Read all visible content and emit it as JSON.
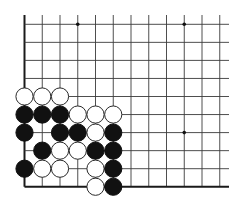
{
  "board": {
    "description": "Go problem diagram, lower-left corner of a 19x19 board",
    "visible_cols": 12,
    "visible_rows": 10,
    "open_top": true,
    "open_right": true,
    "left_edge": true,
    "bottom_edge": true,
    "colors": {
      "background": "#ffffff",
      "line": "#3a3a3a",
      "black": "#111111",
      "white": "#ffffff"
    },
    "hoshi": [
      {
        "col": 3,
        "row": 0
      },
      {
        "col": 9,
        "row": 0
      },
      {
        "col": 3,
        "row": 6
      },
      {
        "col": 9,
        "row": 6
      }
    ],
    "stones": [
      {
        "color": "white",
        "col": 0,
        "row": 4
      },
      {
        "color": "white",
        "col": 1,
        "row": 4
      },
      {
        "color": "white",
        "col": 2,
        "row": 4
      },
      {
        "color": "black",
        "col": 0,
        "row": 5
      },
      {
        "color": "black",
        "col": 1,
        "row": 5
      },
      {
        "color": "black",
        "col": 2,
        "row": 5
      },
      {
        "color": "white",
        "col": 3,
        "row": 5
      },
      {
        "color": "white",
        "col": 4,
        "row": 5
      },
      {
        "color": "white",
        "col": 5,
        "row": 5
      },
      {
        "color": "black",
        "col": 0,
        "row": 6
      },
      {
        "color": "black",
        "col": 2,
        "row": 6
      },
      {
        "color": "black",
        "col": 3,
        "row": 6
      },
      {
        "color": "white",
        "col": 4,
        "row": 6
      },
      {
        "color": "black",
        "col": 5,
        "row": 6
      },
      {
        "color": "black",
        "col": 1,
        "row": 7
      },
      {
        "color": "white",
        "col": 2,
        "row": 7
      },
      {
        "color": "white",
        "col": 3,
        "row": 7
      },
      {
        "color": "black",
        "col": 4,
        "row": 7
      },
      {
        "color": "black",
        "col": 5,
        "row": 7
      },
      {
        "color": "black",
        "col": 0,
        "row": 8
      },
      {
        "color": "white",
        "col": 1,
        "row": 8
      },
      {
        "color": "white",
        "col": 2,
        "row": 8
      },
      {
        "color": "white",
        "col": 4,
        "row": 8
      },
      {
        "color": "black",
        "col": 5,
        "row": 8
      },
      {
        "color": "white",
        "col": 4,
        "row": 9
      },
      {
        "color": "black",
        "col": 5,
        "row": 9
      }
    ]
  }
}
